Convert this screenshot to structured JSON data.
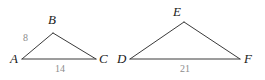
{
  "figure": {
    "background_color": "#ffffff",
    "stroke_color": "#3a3a3a",
    "vertex_label_color": "#1a1a1a",
    "side_label_color": "#8c8c8c"
  },
  "triangle_left": {
    "name": "triangle-abc",
    "vertices": [
      {
        "label": "A",
        "x": 22,
        "y": 59
      },
      {
        "label": "B",
        "x": 53,
        "y": 33
      },
      {
        "label": "C",
        "x": 96,
        "y": 59
      }
    ],
    "vertex_labels": {
      "a": "A",
      "b": "B",
      "c": "C"
    },
    "side_labels": {
      "ab": "8",
      "ac": "14"
    }
  },
  "triangle_right": {
    "name": "triangle-def",
    "vertices": [
      {
        "label": "D",
        "x": 130,
        "y": 59
      },
      {
        "label": "E",
        "x": 184,
        "y": 22
      },
      {
        "label": "F",
        "x": 240,
        "y": 59
      }
    ],
    "vertex_labels": {
      "d": "D",
      "e": "E",
      "f": "F"
    },
    "side_labels": {
      "df": "21"
    }
  }
}
